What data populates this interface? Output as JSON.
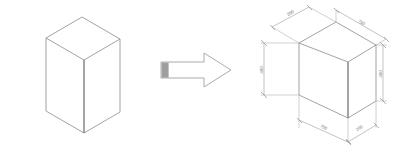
{
  "document": {
    "title": "Isometric Box Transformation Diagram",
    "background_color": "#ffffff",
    "line_color": "#8b8b8b",
    "dimension_line_color": "#9a9a9a",
    "text_color": "#6a6a6a",
    "arrow_fill_color": "#ffffff",
    "arrow_tail_color": "#9e9e9e"
  },
  "left_shape": {
    "name": "plain-isometric-box",
    "label": "",
    "description": "Isometric rectangular box, wireframe outline, no dimensions"
  },
  "transform_arrow": {
    "name": "transform-arrow",
    "label": "",
    "direction": "right"
  },
  "right_shape": {
    "name": "dimensioned-isometric-box",
    "label": "",
    "description": "Isometric rectangular box with five dimension callouts"
  },
  "dimensions": [
    {
      "id": "depth-top-left",
      "label": "200",
      "position": "top-left"
    },
    {
      "id": "length-top-right",
      "label": "750",
      "position": "top-right"
    },
    {
      "id": "height-left",
      "label": "400",
      "position": "left"
    },
    {
      "id": "height-right",
      "label": "400",
      "position": "right"
    },
    {
      "id": "length-bottom",
      "label": "750",
      "position": "bottom-left"
    },
    {
      "id": "depth-bottom",
      "label": "200",
      "position": "bottom-right"
    }
  ]
}
